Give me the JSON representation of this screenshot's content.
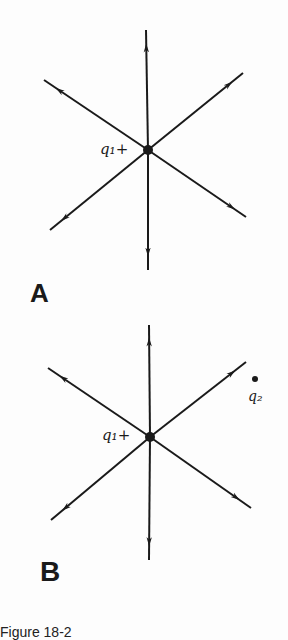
{
  "figure": {
    "caption": "Figure 18-2",
    "panels": [
      {
        "label": "A",
        "charge_label": "q₁",
        "charge_sign": "+",
        "center": [
          148,
          150
        ],
        "field_line_ends": [
          [
            146,
            30
          ],
          [
            148,
            270
          ],
          [
            44,
            80
          ],
          [
            243,
            73
          ],
          [
            50,
            230
          ],
          [
            246,
            217
          ]
        ]
      },
      {
        "label": "B",
        "charge_label": "q₁",
        "charge_sign": "+",
        "center": [
          150,
          437
        ],
        "field_line_ends": [
          [
            149,
            325
          ],
          [
            149,
            560
          ],
          [
            48,
            368
          ],
          [
            246,
            362
          ],
          [
            51,
            520
          ],
          [
            251,
            508
          ]
        ],
        "test_charge": {
          "label": "q₂",
          "position": [
            255,
            379
          ]
        }
      }
    ]
  },
  "colors": {
    "ink": "#1a1a1a",
    "background": "#fdfdfd"
  }
}
